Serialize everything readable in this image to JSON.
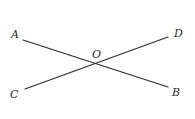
{
  "figure": {
    "type": "intersecting-lines",
    "colors": {
      "background": "#ffffff",
      "stroke": "#2a2a2a",
      "text": "#2a2a2a"
    },
    "points": {
      "A": {
        "label": "A",
        "x": 23,
        "y": 40,
        "label_x": 11,
        "label_y": 38
      },
      "B": {
        "label": "B",
        "x": 168,
        "y": 87,
        "label_x": 172,
        "label_y": 96
      },
      "C": {
        "label": "C",
        "x": 25,
        "y": 89,
        "label_x": 10,
        "label_y": 98
      },
      "D": {
        "label": "D",
        "x": 168,
        "y": 37,
        "label_x": 174,
        "label_y": 37
      },
      "O": {
        "label": "O",
        "x": 96,
        "y": 63,
        "label_x": 92,
        "label_y": 58
      }
    },
    "segments": [
      {
        "name": "AB",
        "from": "A",
        "to": "B"
      },
      {
        "name": "CD",
        "from": "C",
        "to": "D"
      }
    ]
  }
}
